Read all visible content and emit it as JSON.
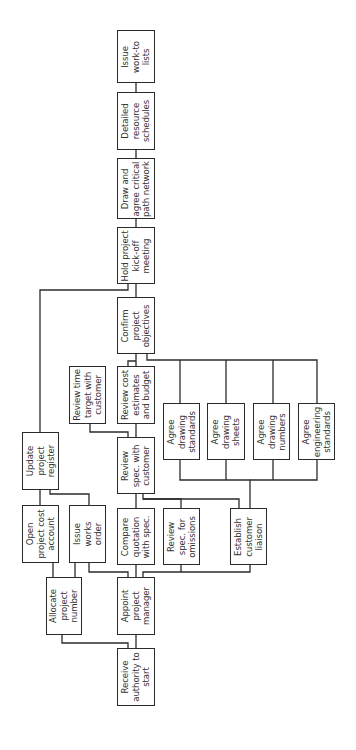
{
  "diagram": {
    "orientation": "rotated-90-ccw",
    "colors": {
      "line": "#2b2b2b",
      "text": "#333333",
      "background": "#ffffff"
    },
    "nodes": [
      {
        "id": "receive",
        "text": "Receive\nauthority to\nstart",
        "x": 117,
        "y": 648,
        "w": 38,
        "h": 58
      },
      {
        "id": "allocate",
        "text": "Allocate\nproject\nnumber",
        "x": 46,
        "y": 577,
        "w": 36,
        "h": 58
      },
      {
        "id": "appoint",
        "text": "Appoint\nproject\nmanager",
        "x": 117,
        "y": 577,
        "w": 38,
        "h": 58
      },
      {
        "id": "opencost",
        "text": "Open\nproject cost\naccount",
        "x": 22,
        "y": 505,
        "w": 37,
        "h": 58
      },
      {
        "id": "worksorder",
        "text": "Issue\nworks\norder",
        "x": 69,
        "y": 505,
        "w": 37,
        "h": 58
      },
      {
        "id": "compare",
        "text": "Compare\nquotation\nwith spec.",
        "x": 117,
        "y": 508,
        "w": 38,
        "h": 57
      },
      {
        "id": "omissions",
        "text": "Review\nspec. for\nomissions",
        "x": 163,
        "y": 508,
        "w": 37,
        "h": 57
      },
      {
        "id": "liaison",
        "text": "Establish\ncustomer\nliaison",
        "x": 230,
        "y": 508,
        "w": 37,
        "h": 57
      },
      {
        "id": "register",
        "text": "Update\nproject\nregister",
        "x": 22,
        "y": 432,
        "w": 37,
        "h": 58
      },
      {
        "id": "specwith",
        "text": "Review\nspec. with\ncustomer",
        "x": 117,
        "y": 437,
        "w": 38,
        "h": 57
      },
      {
        "id": "timetarget",
        "text": "Review time\ntarget with\ncustomer",
        "x": 69,
        "y": 366,
        "w": 37,
        "h": 58
      },
      {
        "id": "cost",
        "text": "Review cost\nestimates\nand budget",
        "x": 117,
        "y": 366,
        "w": 38,
        "h": 58
      },
      {
        "id": "drawstd",
        "text": "Agree\ndrawing\nstandards",
        "x": 163,
        "y": 403,
        "w": 37,
        "h": 57
      },
      {
        "id": "drawsheets",
        "text": "Agree\ndrawing\nsheets",
        "x": 207,
        "y": 403,
        "w": 38,
        "h": 57
      },
      {
        "id": "drawnum",
        "text": "Agree\ndrawing\nnumbers",
        "x": 253,
        "y": 403,
        "w": 37,
        "h": 57
      },
      {
        "id": "engstd",
        "text": "Agree\nengineering\nstandards",
        "x": 298,
        "y": 403,
        "w": 37,
        "h": 57
      },
      {
        "id": "objectives",
        "text": "Confirm\nproject\nobjectives",
        "x": 117,
        "y": 297,
        "w": 38,
        "h": 57
      },
      {
        "id": "kickoff",
        "text": "Hold project\nkick-off\nmeeting",
        "x": 117,
        "y": 227,
        "w": 38,
        "h": 57
      },
      {
        "id": "cpn",
        "text": "Draw and\nagree critical\npath network",
        "x": 117,
        "y": 158,
        "w": 38,
        "h": 61
      },
      {
        "id": "resource",
        "text": "Detailed\nresource\nschedules",
        "x": 117,
        "y": 92,
        "w": 38,
        "h": 58
      },
      {
        "id": "worklists",
        "text": "Issue\nwork-to\nlists",
        "x": 117,
        "y": 30,
        "w": 38,
        "h": 53
      }
    ],
    "links": [
      "M136,648 V635",
      "M128,648 V643 H62 V635",
      "M53,577 V563",
      "M75,577 V563",
      "M40,505 V490",
      "M50,490 V494 H89 V505",
      "M128,577 V572 H89 V563",
      "M136,577 V565",
      "M143,577 V572 H250 V565",
      "M181,572 V565",
      "M136,508 V494",
      "M143,494 V499 H181 V508",
      "M143,499 H239 V508",
      "M250,508 V480 H180 V460",
      "M250,480 H317 V460",
      "M226,480 V460",
      "M273,480 V460",
      "M136,437 V424",
      "M128,437 V432 H90 V424",
      "M136,366 V354",
      "M128,366 V361 H136",
      "M147,354 V360 H317 V403",
      "M180,360 V403",
      "M226,360 V403",
      "M273,360 V403",
      "M136,297 V284",
      "M40,432 V290 H128 V284",
      "M136,227 V219",
      "M136,158 V150",
      "M136,92 V83"
    ]
  }
}
